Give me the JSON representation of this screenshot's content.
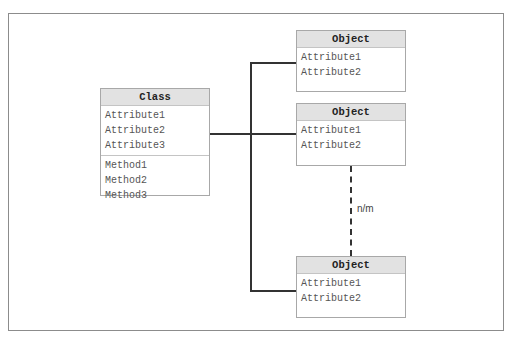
{
  "class_box": {
    "title": "Class",
    "attributes": [
      "Attribute1",
      "Attribute2",
      "Attribute3"
    ],
    "methods": [
      "Method1",
      "Method2",
      "Method3"
    ]
  },
  "objects": [
    {
      "title": "Object",
      "attributes": [
        "Attribute1",
        "Attribute2"
      ]
    },
    {
      "title": "Object",
      "attributes": [
        "Attribute1",
        "Attribute2"
      ]
    },
    {
      "title": "Object",
      "attributes": [
        "Attribute1",
        "Attribute2"
      ]
    }
  ],
  "connector_label": "n/m",
  "colors": {
    "header_bg": "#e2e2e2",
    "border": "#a8a8a8",
    "line": "#333333",
    "text": "#555555"
  }
}
